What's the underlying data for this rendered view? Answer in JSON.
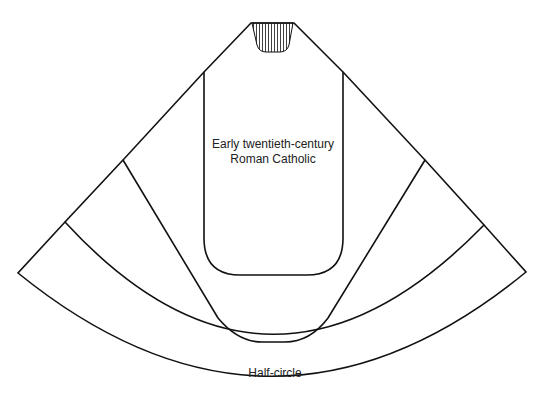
{
  "diagram": {
    "labels": {
      "inner_line1": "Early twentieth-century",
      "inner_line2": "Roman Catholic",
      "outer": "Half-circle"
    },
    "shapes": [
      {
        "name": "early-twentieth-century-roman-catholic",
        "description": "Narrow fiddleback form with rounded bottom corners"
      },
      {
        "name": "intermediate-form-1",
        "description": "Wider tapered form"
      },
      {
        "name": "intermediate-form-2",
        "description": "Wider curved form"
      },
      {
        "name": "half-circle",
        "description": "Full half-circle form"
      }
    ],
    "neck": {
      "fill": "vertical hatching"
    },
    "colors": {
      "stroke": "#111111",
      "background": "#ffffff"
    }
  }
}
